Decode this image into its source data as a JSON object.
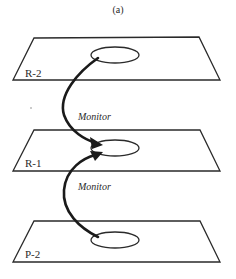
{
  "diagram": {
    "title": "(a)",
    "planes": [
      {
        "id": "R-2",
        "label": "R-2",
        "level": "top"
      },
      {
        "id": "R-1",
        "label": "R-1",
        "level": "middle"
      },
      {
        "id": "P-2",
        "label": "P-2",
        "level": "bottom"
      }
    ],
    "edges": [
      {
        "from": "R-2",
        "to": "R-1",
        "label": "Monitor"
      },
      {
        "from": "P-2",
        "to": "R-1",
        "label": "Monitor"
      }
    ],
    "colors": {
      "stroke": "#2a2a2a",
      "arrow": "#1a1a1a",
      "background": "#ffffff"
    }
  }
}
